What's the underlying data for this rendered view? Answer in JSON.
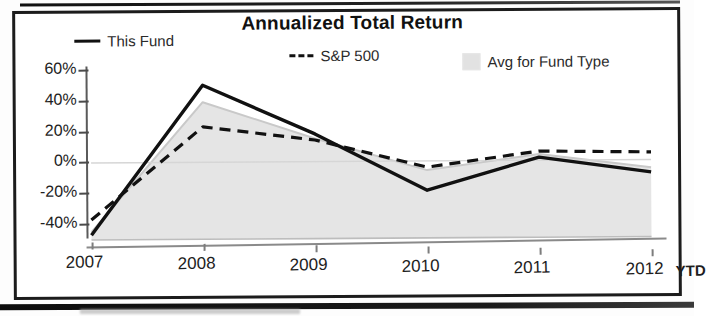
{
  "chart_data": {
    "type": "line",
    "title": "Annualized Total Return",
    "xlabel": "",
    "ylabel": "",
    "categories": [
      "2007",
      "2008",
      "2009",
      "2010",
      "2011",
      "2012"
    ],
    "x_axis_note": "YTD",
    "ylim": [
      -50,
      60
    ],
    "ytick_labels": [
      "60%",
      "40%",
      "20%",
      "0%",
      "-20%",
      "-40%"
    ],
    "ytick_values": [
      60,
      40,
      20,
      0,
      -20,
      -40
    ],
    "grid": false,
    "legend_position": "top",
    "series": [
      {
        "name": "This Fund",
        "style": "solid",
        "color": "#111111",
        "values": [
          -47,
          50,
          18,
          -19,
          2,
          -8
        ]
      },
      {
        "name": "S&P 500",
        "style": "dashed",
        "color": "#111111",
        "values": [
          -37,
          23,
          14,
          -4,
          6,
          5
        ]
      },
      {
        "name": "Avg for Fund Type",
        "style": "band",
        "color": "#e2e2e2",
        "values": [
          -45,
          39,
          15,
          -6,
          4,
          -5
        ],
        "band_lower": [
          -50,
          -50,
          -50,
          -50,
          -50,
          -50
        ]
      }
    ]
  },
  "chart": {
    "title": "Annualized Total Return",
    "legend": [
      {
        "label": "This Fund",
        "marker": "solid-line"
      },
      {
        "label": "S&P 500",
        "marker": "dashed-line"
      },
      {
        "label": "Avg for Fund Type",
        "marker": "gray-swatch"
      }
    ],
    "y_axis": {
      "labels": [
        "60%",
        "40%",
        "20%",
        "0%",
        "-20%",
        "-40%"
      ]
    },
    "x_axis": {
      "labels": [
        "2007",
        "2008",
        "2009",
        "2010",
        "2011",
        "2012"
      ],
      "suffix": "YTD"
    },
    "colors": {
      "line": "#111111",
      "band": "#e2e2e2",
      "axis": "#5a5a5a",
      "frame": "#1c1c1c"
    }
  }
}
